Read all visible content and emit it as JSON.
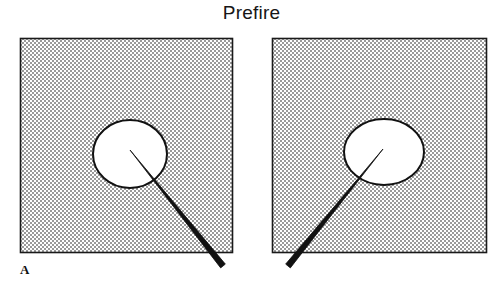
{
  "figure": {
    "title": "Prefire",
    "panel_label": "A",
    "background_color": "#ffffff",
    "ink_color": "#111111",
    "stipple_color": "#8c8c8c",
    "border_color": "#1a1a1a",
    "needle_color": "#111111",
    "circle_fill": "#ffffff"
  },
  "panels": [
    {
      "id": "left",
      "name": "left-tissue-panel",
      "box": {
        "x": 20,
        "y": 38,
        "width": 212,
        "height": 214
      },
      "target": {
        "name": "left-target-circle",
        "shape": "circle",
        "cx": 130,
        "cy": 154,
        "rx": 37,
        "ry": 34
      },
      "needle": {
        "name": "left-needle",
        "tip_x": 130,
        "tip_y": 150,
        "tail_x": 223,
        "tail_y": 266,
        "entry_side": "lower-right",
        "tip_width": 1,
        "tail_width": 6
      }
    },
    {
      "id": "right",
      "name": "right-tissue-panel",
      "box": {
        "x": 272,
        "y": 38,
        "width": 214,
        "height": 214
      },
      "target": {
        "name": "right-target-circle",
        "shape": "ellipse",
        "cx": 384,
        "cy": 152,
        "rx": 40,
        "ry": 33
      },
      "needle": {
        "name": "right-needle",
        "tip_x": 383,
        "tip_y": 149,
        "tail_x": 288,
        "tail_y": 266,
        "entry_side": "lower-left",
        "tip_width": 1,
        "tail_width": 6
      }
    }
  ]
}
